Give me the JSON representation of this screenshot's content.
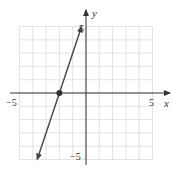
{
  "chart_data": {
    "type": "line",
    "title": "",
    "xlabel": "x",
    "ylabel": "y",
    "xlim": [
      -5,
      5
    ],
    "ylim": [
      -5,
      5
    ],
    "grid": true,
    "x_ticks_labeled": [
      "-5",
      "5"
    ],
    "y_ticks_labeled": [
      "5",
      "-5"
    ],
    "series": [
      {
        "name": "y = 3x + 6",
        "equation": "y = 3x + 6",
        "x": [
          -3.67,
          -0.33
        ],
        "y": [
          -5,
          5
        ],
        "arrows": "both ends"
      }
    ],
    "points": [
      {
        "x": -2,
        "y": 0,
        "label": ""
      }
    ]
  },
  "labels": {
    "x_axis": "x",
    "y_axis": "y",
    "x_min": "−5",
    "x_max": "5",
    "y_max": "5",
    "y_min": "−5"
  },
  "colors": {
    "grid": "#dcdcdc",
    "axis": "#333333",
    "line": "#444444",
    "point": "#333333"
  }
}
